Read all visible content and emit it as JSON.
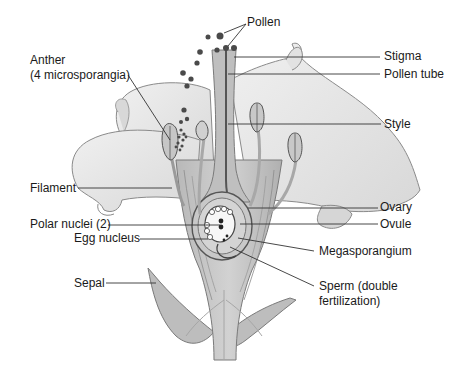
{
  "diagram": {
    "colors": {
      "background": "#ffffff",
      "petal_fill": "#e6e6e6",
      "petal_stroke": "#8a8a8a",
      "tissue_fill": "#c4c4c4",
      "dark_stroke": "#555555",
      "pollen": "#4a4a4a",
      "leader_line": "#333333",
      "text": "#1a1a1a"
    },
    "labels": {
      "pollen": "Pollen",
      "stigma": "Stigma",
      "pollen_tube": "Pollen tube",
      "style": "Style",
      "anther_line1": "Anther",
      "anther_line2": "(4 microsporangia)",
      "filament": "Filament",
      "ovary": "Ovary",
      "ovule": "Ovule",
      "polar_nuclei": "Polar nuclei (2)",
      "egg_nucleus": "Egg nucleus",
      "megasporangium": "Megasporangium",
      "sperm_line1": "Sperm (double",
      "sperm_line2": "fertilization)",
      "sepal": "Sepal"
    }
  }
}
